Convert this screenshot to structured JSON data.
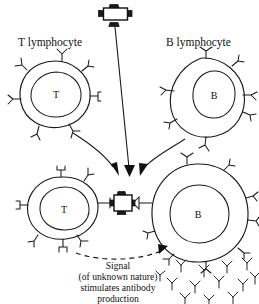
{
  "figure": {
    "background_color": "#ffffff",
    "ink_color": "#111111"
  },
  "labels": {
    "t_lymphocyte": "T lymphocyte",
    "b_lymphocyte": "B lymphocyte",
    "t_nucleus_top": "T",
    "b_nucleus_top": "B",
    "t_nucleus_bottom": "T",
    "b_nucleus_bottom": "B"
  },
  "caption": {
    "line1": "Signal",
    "line2": "(of unknown nature)",
    "line3": "stimulates antibody",
    "line4": "production"
  },
  "elements": {
    "antigen_top_name": "antigen-particle",
    "antigen_center_name": "antigen-particle-bound",
    "antibody_cloud_count": 13,
    "arrow_count": 3
  }
}
